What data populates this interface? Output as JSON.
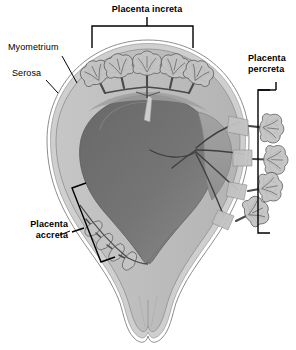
{
  "figure": {
    "title_visible": false,
    "background_color": "#ffffff"
  },
  "labels": {
    "increta": {
      "text": "Placenta increta",
      "weight": "bold",
      "align": "center",
      "x": 147,
      "y": 4,
      "connector": "top-bracket"
    },
    "percreta": {
      "line1": "Placenta",
      "line2": "percreta",
      "weight": "bold",
      "align": "left",
      "x": 248,
      "y": 53,
      "connector": "right-bracket"
    },
    "accreta": {
      "line1": "Placenta",
      "line2": "accreta",
      "weight": "bold",
      "align": "right",
      "x": 68,
      "y": 219,
      "connector": "angled-bracket-with-leader"
    },
    "myometrium": {
      "text": "Myometrium",
      "weight": "normal",
      "align": "left",
      "x": 8,
      "y": 42,
      "connector": "leader-line"
    },
    "serosa": {
      "text": "Serosa",
      "weight": "normal",
      "align": "left",
      "x": 12,
      "y": 68,
      "connector": "leader-line"
    }
  },
  "colors": {
    "outline": "#000000",
    "serosa_band": "#cfcfcf",
    "serosa_edge": "#ffffff",
    "myometrium": "#b9b9b9",
    "myometrium_light": "#c9c9c9",
    "cavity_dark": "#6e6e6e",
    "cavity_mid": "#7d7d7d",
    "placenta_mass": "#9a9a9a",
    "villi_fill": "#c4c4c4",
    "villi_stroke": "#4a4a4a",
    "bracket": "#000000",
    "text": "#000000"
  },
  "anatomy": {
    "regions": [
      {
        "name": "fundus-dome",
        "description": "rounded upper uterine dome"
      },
      {
        "name": "uterine-cavity",
        "description": "dark gray central cavity containing placental mass"
      },
      {
        "name": "myometrium-wall",
        "description": "light gray muscular wall surrounding cavity"
      },
      {
        "name": "serosa-layer",
        "description": "thin outer band at uterine surface"
      },
      {
        "name": "cervix",
        "description": "narrow inferior twin-lobed outlet"
      }
    ],
    "villous_groups": [
      {
        "name": "increta-villi",
        "count": 5,
        "location": "fundus, invading into myometrium"
      },
      {
        "name": "percreta-villi",
        "count": 4,
        "location": "right lateral wall, penetrating through serosa"
      },
      {
        "name": "accreta-villi",
        "count": 4,
        "location": "lower left wall, superficial attachment to myometrium"
      }
    ]
  },
  "brackets": {
    "increta": {
      "x1": 92,
      "x2": 193,
      "y": 26,
      "drop": 22,
      "stem_x": 147,
      "stem_top": 16
    },
    "percreta": {
      "x": 258,
      "y1": 90,
      "y2": 233,
      "tick": 12,
      "stem_y": 82,
      "stem_x": 276
    },
    "accreta": {
      "x1": 72,
      "y1": 186,
      "x2": 101,
      "y2": 262,
      "leader_from_x": 72,
      "leader_to_x": 86,
      "leader_y": 230
    }
  }
}
